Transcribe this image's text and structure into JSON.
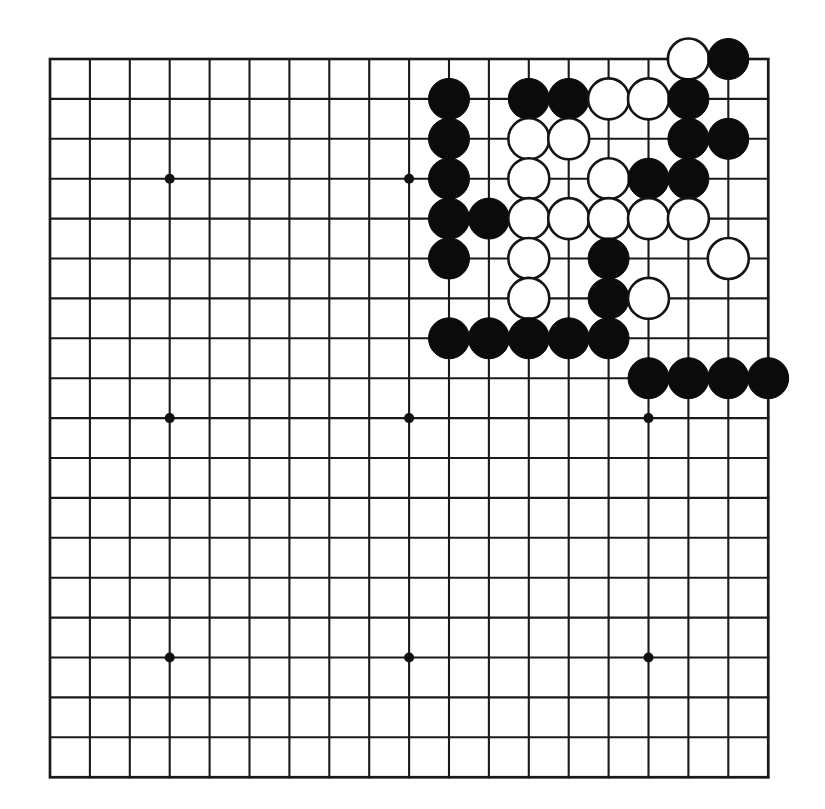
{
  "figure": {
    "kind": "go-board-diagram",
    "board_size": 19,
    "background_color": "#ffffff",
    "line_color": "#1a1a1a",
    "black_stone_color": "#0b0b0b",
    "white_stone_color": "#ffffff"
  },
  "geometry": {
    "origin_x": 50,
    "origin_y": 59,
    "spacing": 39.9,
    "stone_radius": 20.5,
    "star_radius": 5.0
  },
  "star_points": [
    {
      "col": 3,
      "row": 3
    },
    {
      "col": 9,
      "row": 3
    },
    {
      "col": 15,
      "row": 3
    },
    {
      "col": 3,
      "row": 9
    },
    {
      "col": 9,
      "row": 9
    },
    {
      "col": 15,
      "row": 9
    },
    {
      "col": 3,
      "row": 15
    },
    {
      "col": 9,
      "row": 15
    },
    {
      "col": 15,
      "row": 15
    }
  ],
  "stones": [
    {
      "col": 16,
      "row": 0,
      "color": "white"
    },
    {
      "col": 17,
      "row": 0,
      "color": "black"
    },
    {
      "col": 10,
      "row": 1,
      "color": "black"
    },
    {
      "col": 12,
      "row": 1,
      "color": "black"
    },
    {
      "col": 13,
      "row": 1,
      "color": "black"
    },
    {
      "col": 14,
      "row": 1,
      "color": "white"
    },
    {
      "col": 15,
      "row": 1,
      "color": "white"
    },
    {
      "col": 16,
      "row": 1,
      "color": "black"
    },
    {
      "col": 10,
      "row": 2,
      "color": "black"
    },
    {
      "col": 12,
      "row": 2,
      "color": "white"
    },
    {
      "col": 13,
      "row": 2,
      "color": "white"
    },
    {
      "col": 16,
      "row": 2,
      "color": "black"
    },
    {
      "col": 17,
      "row": 2,
      "color": "black"
    },
    {
      "col": 10,
      "row": 3,
      "color": "black"
    },
    {
      "col": 12,
      "row": 3,
      "color": "white"
    },
    {
      "col": 14,
      "row": 3,
      "color": "white"
    },
    {
      "col": 15,
      "row": 3,
      "color": "black"
    },
    {
      "col": 16,
      "row": 3,
      "color": "black"
    },
    {
      "col": 10,
      "row": 4,
      "color": "black"
    },
    {
      "col": 11,
      "row": 4,
      "color": "black"
    },
    {
      "col": 12,
      "row": 4,
      "color": "white"
    },
    {
      "col": 13,
      "row": 4,
      "color": "white"
    },
    {
      "col": 14,
      "row": 4,
      "color": "white"
    },
    {
      "col": 15,
      "row": 4,
      "color": "white"
    },
    {
      "col": 16,
      "row": 4,
      "color": "white"
    },
    {
      "col": 10,
      "row": 5,
      "color": "black"
    },
    {
      "col": 12,
      "row": 5,
      "color": "white"
    },
    {
      "col": 14,
      "row": 5,
      "color": "black"
    },
    {
      "col": 17,
      "row": 5,
      "color": "white"
    },
    {
      "col": 12,
      "row": 6,
      "color": "white"
    },
    {
      "col": 14,
      "row": 6,
      "color": "black"
    },
    {
      "col": 15,
      "row": 6,
      "color": "white"
    },
    {
      "col": 10,
      "row": 7,
      "color": "black"
    },
    {
      "col": 11,
      "row": 7,
      "color": "black"
    },
    {
      "col": 12,
      "row": 7,
      "color": "black"
    },
    {
      "col": 13,
      "row": 7,
      "color": "black"
    },
    {
      "col": 14,
      "row": 7,
      "color": "black"
    },
    {
      "col": 15,
      "row": 8,
      "color": "black"
    },
    {
      "col": 16,
      "row": 8,
      "color": "black"
    },
    {
      "col": 17,
      "row": 8,
      "color": "black"
    },
    {
      "col": 18,
      "row": 8,
      "color": "black"
    }
  ],
  "counts": {
    "black_stones": 25,
    "white_stones": 16,
    "total_stones": 41
  }
}
